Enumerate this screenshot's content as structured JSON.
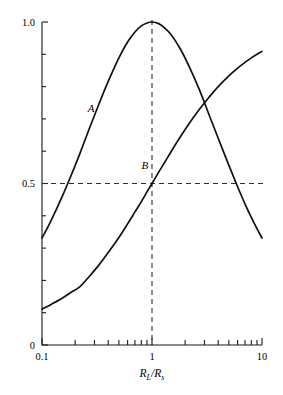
{
  "chart_data": {
    "type": "line",
    "title": "",
    "xlabel": "R_L/R_s",
    "xlabel_main_1": "R",
    "xlabel_sub_1": "L",
    "xlabel_slash": "/",
    "xlabel_main_2": "R",
    "xlabel_sub_2": "s",
    "ylabel": "",
    "xscale": "log",
    "xlim": [
      0.1,
      10
    ],
    "ylim": [
      0,
      1.0
    ],
    "grid": false,
    "legend_position": "inline-curve-labels",
    "x_tick_labels": [
      "0.1",
      "1",
      "10"
    ],
    "x_tick_values": [
      0.1,
      1,
      10
    ],
    "x_minor_ticks": [
      0.2,
      0.3,
      0.4,
      0.5,
      0.6,
      0.7,
      0.8,
      0.9,
      2,
      3,
      4,
      5,
      6,
      7,
      8,
      9
    ],
    "y_tick_labels": [
      "0",
      "0.5",
      "1.0"
    ],
    "y_tick_values": [
      0,
      0.5,
      1.0
    ],
    "y_minor_ticks": [
      0.1,
      0.2,
      0.3,
      0.4,
      0.6,
      0.7,
      0.8,
      0.9
    ],
    "annotations": [
      {
        "text": "A",
        "x": 0.28,
        "y": 0.72,
        "name": "curve-label-a"
      },
      {
        "text": "B",
        "x": 0.86,
        "y": 0.545,
        "name": "curve-label-b"
      }
    ],
    "guides": [
      {
        "orientation": "horizontal",
        "value": 0.5,
        "style": "dashed"
      },
      {
        "orientation": "vertical",
        "value": 1.0,
        "style": "dashed"
      }
    ],
    "series": [
      {
        "name": "A",
        "formula": "4r/(1+r)^2",
        "x": [
          0.1,
          0.12,
          0.15,
          0.18,
          0.22,
          0.27,
          0.33,
          0.4,
          0.5,
          0.6,
          0.7,
          0.8,
          0.9,
          1.0,
          1.15,
          1.3,
          1.5,
          1.8,
          2.2,
          2.7,
          3.3,
          4.0,
          5.0,
          6.0,
          7.0,
          8.0,
          9.0,
          10.0
        ],
        "values": [
          0.331,
          0.383,
          0.454,
          0.517,
          0.591,
          0.671,
          0.747,
          0.816,
          0.889,
          0.938,
          0.969,
          0.988,
          0.997,
          1.0,
          0.995,
          0.982,
          0.96,
          0.918,
          0.859,
          0.79,
          0.713,
          0.64,
          0.556,
          0.49,
          0.437,
          0.395,
          0.36,
          0.331
        ]
      },
      {
        "name": "B",
        "formula": "r/(1+r)",
        "x": [
          0.1,
          0.12,
          0.15,
          0.18,
          0.22,
          0.27,
          0.33,
          0.4,
          0.5,
          0.6,
          0.7,
          0.8,
          0.9,
          1.0,
          1.15,
          1.3,
          1.5,
          1.8,
          2.2,
          2.7,
          3.3,
          4.0,
          5.0,
          6.0,
          7.0,
          8.0,
          9.0,
          10.0
        ],
        "values": [
          0.111,
          0.125,
          0.143,
          0.161,
          0.18,
          0.213,
          0.248,
          0.286,
          0.333,
          0.375,
          0.412,
          0.444,
          0.474,
          0.5,
          0.535,
          0.565,
          0.6,
          0.643,
          0.688,
          0.73,
          0.767,
          0.8,
          0.833,
          0.857,
          0.875,
          0.889,
          0.9,
          0.909
        ]
      }
    ],
    "colors": {
      "curve": "#111111",
      "axis": "#1a1a1a",
      "guide": "#2b2b2b",
      "background": "#ffffff"
    }
  }
}
